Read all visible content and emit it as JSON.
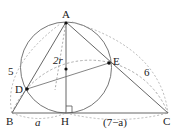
{
  "diagram": {
    "type": "geometry",
    "points": {
      "A": {
        "label": "A",
        "x": 66,
        "y": 22
      },
      "B": {
        "label": "B",
        "x": 12,
        "y": 113
      },
      "C": {
        "label": "C",
        "x": 168,
        "y": 113
      },
      "H": {
        "label": "H",
        "x": 66,
        "y": 113
      },
      "D": {
        "label": "D",
        "x": 27,
        "y": 89
      },
      "E": {
        "label": "E",
        "x": 109,
        "y": 63
      }
    },
    "labels": {
      "ab_length": "5",
      "ac_length": "6",
      "ah_length": "2r",
      "bh_length": "a",
      "hc_length": "(7−a)"
    },
    "colors": {
      "line": "#444444",
      "dashed": "#888888",
      "point": "#111111"
    }
  }
}
